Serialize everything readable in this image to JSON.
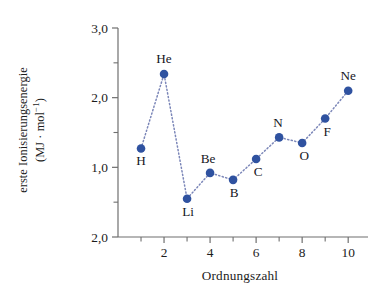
{
  "chart_data": {
    "type": "scatter",
    "title": "",
    "xlabel": "Ordnungszahl",
    "ylabel_lines": [
      "erste Ionisierungsenergie",
      "(MJ · mol⁻¹)"
    ],
    "ylabel": "erste Ionisierungsenergie (MJ · mol⁻¹)",
    "x": [
      1,
      2,
      3,
      4,
      5,
      6,
      7,
      8,
      9,
      10
    ],
    "values": [
      1.27,
      2.34,
      0.55,
      0.92,
      0.82,
      1.12,
      1.43,
      1.35,
      1.7,
      2.1
    ],
    "point_labels": [
      "H",
      "He",
      "Li",
      "Be",
      "B",
      "C",
      "N",
      "O",
      "F",
      "Ne"
    ],
    "label_positions": [
      "below",
      "above",
      "below",
      "above",
      "below",
      "below",
      "above",
      "below",
      "below",
      "above"
    ],
    "xlim": [
      0,
      10.6
    ],
    "ylim": [
      0,
      3.0
    ],
    "xticks": [
      2,
      4,
      6,
      8,
      10
    ],
    "xtick_labels": [
      "2",
      "4",
      "6",
      "8",
      "10"
    ],
    "xminor_ticks": [
      1,
      3,
      5,
      7,
      9
    ],
    "yticks": [
      3.0,
      2.0,
      1.0,
      0.0
    ],
    "ytick_labels": [
      "3,0",
      "2,0",
      "1,0",
      "2,0"
    ],
    "yminor_ticks": [
      2.5,
      1.5,
      0.5
    ],
    "grid": false,
    "legend": false,
    "marker_color": "#2f52a0",
    "line_style": "dotted",
    "line_color": "#7b86b8",
    "axis_color": "#6f6f6f"
  },
  "axes": {
    "x_title": "Ordnungszahl",
    "y_title_line1": "erste Ionisierungsenergie",
    "y_title_line2_prefix": "(MJ · mol",
    "y_title_line2_sup": "−1",
    "y_title_line2_suffix": ")"
  }
}
